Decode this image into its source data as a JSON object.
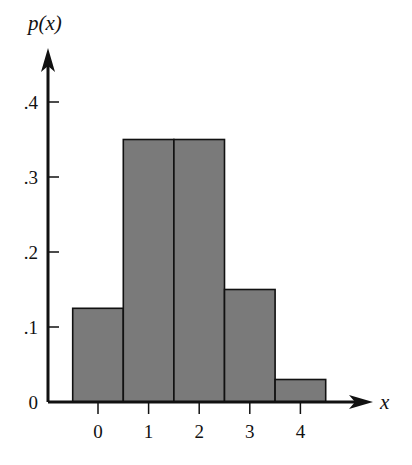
{
  "chart_data": {
    "type": "bar",
    "title": "",
    "xlabel": "x",
    "ylabel": "p(x)",
    "categories": [
      "0",
      "1",
      "2",
      "3",
      "4"
    ],
    "values": [
      0.125,
      0.35,
      0.35,
      0.15,
      0.03
    ],
    "yticks": [
      0,
      0.1,
      0.2,
      0.3,
      0.4
    ],
    "ytick_labels": [
      "0",
      ".1",
      ".2",
      ".3",
      ".4"
    ],
    "xticks": [
      0,
      1,
      2,
      3,
      4
    ],
    "xtick_labels": [
      "0",
      "1",
      "2",
      "3",
      "4"
    ],
    "ylim": [
      0,
      0.47
    ],
    "grid": false,
    "legend": null,
    "bar_style": "histogram (adjacent bars, no gaps)",
    "colors": {
      "bar_fill": "#7a7a7a",
      "bar_edge": "#111111",
      "axis": "#111111"
    }
  }
}
